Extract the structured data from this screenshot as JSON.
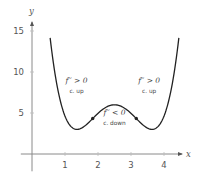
{
  "chart_data": {
    "type": "line",
    "title": "",
    "xlabel": "x",
    "ylabel": "y",
    "xlim": [
      -0.4,
      4.6
    ],
    "ylim": [
      -1.5,
      16.5
    ],
    "x_ticks": [
      1,
      2,
      3,
      4
    ],
    "x_tick_labels": [
      "1",
      "2",
      "3",
      "4"
    ],
    "y_ticks": [
      5,
      10,
      15
    ],
    "y_tick_labels": [
      "5",
      "10",
      "15"
    ],
    "grid": false,
    "legend": null,
    "function": {
      "description": "symmetric quartic about x = 2.5",
      "formula": "f(x) = 1.78(x-2.5)^4 - 4.62(x-2.5)^2 + 6",
      "domain": [
        0.55,
        4.45
      ],
      "points": [
        {
          "x": 0.55,
          "y": 16.0
        },
        {
          "x": 0.8,
          "y": 11.5
        },
        {
          "x": 1.0,
          "y": 8.6
        },
        {
          "x": 1.2,
          "y": 5.2
        },
        {
          "x": 1.36,
          "y": 3.0
        },
        {
          "x": 1.6,
          "y": 3.4
        },
        {
          "x": 1.84,
          "y": 4.3
        },
        {
          "x": 2.1,
          "y": 5.3
        },
        {
          "x": 2.5,
          "y": 6.0
        },
        {
          "x": 2.9,
          "y": 5.3
        },
        {
          "x": 3.16,
          "y": 4.3
        },
        {
          "x": 3.4,
          "y": 3.4
        },
        {
          "x": 3.64,
          "y": 3.0
        },
        {
          "x": 3.8,
          "y": 5.2
        },
        {
          "x": 4.0,
          "y": 8.6
        },
        {
          "x": 4.2,
          "y": 11.5
        },
        {
          "x": 4.45,
          "y": 16.0
        }
      ],
      "coefficients": {
        "a": 1.78,
        "b": 4.62,
        "c": 6,
        "h": 2.5
      }
    },
    "inflection_points": [
      {
        "x": 1.84,
        "y": 4.33
      },
      {
        "x": 3.16,
        "y": 4.33
      }
    ],
    "annotations": [
      {
        "id": "left",
        "main": "f′′ > 0",
        "sub": "c. up",
        "x": 1.35,
        "y": 8.7
      },
      {
        "id": "middle",
        "main": "f′′ < 0",
        "sub": "c. down",
        "x": 2.5,
        "y": 4.7
      },
      {
        "id": "right",
        "main": "f′′ > 0",
        "sub": "c. up",
        "x": 3.55,
        "y": 8.7
      }
    ]
  }
}
